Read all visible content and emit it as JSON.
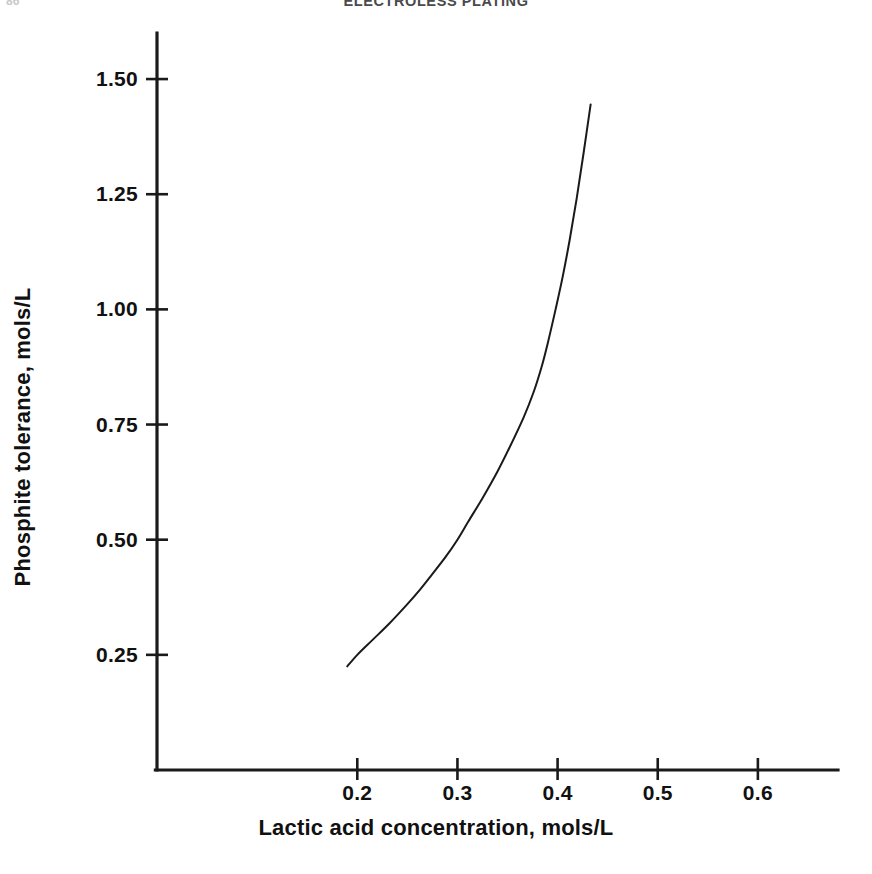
{
  "page": {
    "running_head": "ELECTROLESS PLATING",
    "page_number": "86"
  },
  "chart_data": {
    "type": "line",
    "title": "",
    "xlabel": "Lactic acid concentration, mols/L",
    "ylabel": "Phosphite tolerance, mols/L",
    "xlim": [
      0.0,
      0.68
    ],
    "ylim": [
      0.0,
      1.6
    ],
    "xticks": [
      0.2,
      0.3,
      0.4,
      0.5,
      0.6
    ],
    "xtick_labels": [
      "0.2",
      "0.3",
      "0.4",
      "0.5",
      "0.6"
    ],
    "yticks": [
      0.25,
      0.5,
      0.75,
      1.0,
      1.25,
      1.5
    ],
    "ytick_labels": [
      "0.25",
      "0.50",
      "0.75",
      "1.00",
      "1.25",
      "1.50"
    ],
    "grid": false,
    "legend": null,
    "series": [
      {
        "name": "Phosphite tolerance curve",
        "color": "#1a1a1a",
        "line_width": 2,
        "x": [
          0.19,
          0.2,
          0.215,
          0.232,
          0.25,
          0.262,
          0.273,
          0.288,
          0.3,
          0.311,
          0.325,
          0.34,
          0.352,
          0.366,
          0.376,
          0.384,
          0.39,
          0.398,
          0.405,
          0.412,
          0.419,
          0.426,
          0.433
        ],
        "y": [
          0.225,
          0.25,
          0.282,
          0.318,
          0.36,
          0.39,
          0.42,
          0.462,
          0.5,
          0.54,
          0.59,
          0.648,
          0.7,
          0.765,
          0.82,
          0.875,
          0.925,
          1.0,
          1.07,
          1.15,
          1.24,
          1.34,
          1.445
        ]
      }
    ]
  }
}
